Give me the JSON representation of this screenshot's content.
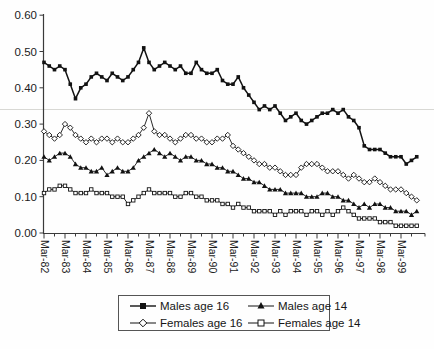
{
  "chart_data": {
    "type": "line",
    "title": "",
    "xlabel": "",
    "ylabel": "",
    "ylim": [
      0.0,
      0.6
    ],
    "y_tick_labels": [
      "0.00",
      "0.10",
      "0.20",
      "0.30",
      "0.40",
      "0.50",
      "0.60"
    ],
    "x_tick_labels": [
      "Mar-82",
      "Mar-83",
      "Mar-84",
      "Mar-85",
      "Mar-86",
      "Mar-87",
      "Mar-88",
      "Mar-89",
      "Mar-90",
      "Mar-91",
      "Mar-92",
      "Mar-93",
      "Mar-94",
      "Mar-95",
      "Mar-96",
      "Mar-97",
      "Mar-98",
      "Mar-99"
    ],
    "x_resolution": "quarterly, Mar-1982 to Dec-1999",
    "grid": "off",
    "legend_position": "bottom",
    "series": [
      {
        "name": "Males age 16",
        "marker": "filled-square",
        "values": [
          0.47,
          0.46,
          0.45,
          0.46,
          0.45,
          0.41,
          0.37,
          0.4,
          0.41,
          0.43,
          0.44,
          0.43,
          0.42,
          0.44,
          0.43,
          0.42,
          0.43,
          0.45,
          0.47,
          0.51,
          0.47,
          0.45,
          0.46,
          0.47,
          0.46,
          0.45,
          0.46,
          0.44,
          0.44,
          0.47,
          0.45,
          0.44,
          0.44,
          0.45,
          0.42,
          0.41,
          0.41,
          0.43,
          0.4,
          0.38,
          0.36,
          0.34,
          0.35,
          0.34,
          0.35,
          0.33,
          0.31,
          0.32,
          0.33,
          0.31,
          0.3,
          0.31,
          0.32,
          0.33,
          0.33,
          0.34,
          0.33,
          0.34,
          0.32,
          0.31,
          0.29,
          0.24,
          0.23,
          0.23,
          0.23,
          0.22,
          0.21,
          0.21,
          0.21,
          0.19,
          0.2,
          0.21
        ]
      },
      {
        "name": "Females age 16",
        "marker": "open-diamond",
        "values": [
          0.28,
          0.27,
          0.26,
          0.27,
          0.3,
          0.29,
          0.27,
          0.26,
          0.25,
          0.26,
          0.25,
          0.26,
          0.26,
          0.25,
          0.26,
          0.25,
          0.25,
          0.26,
          0.27,
          0.29,
          0.33,
          0.28,
          0.27,
          0.27,
          0.26,
          0.25,
          0.26,
          0.27,
          0.27,
          0.26,
          0.26,
          0.25,
          0.25,
          0.26,
          0.26,
          0.27,
          0.24,
          0.23,
          0.22,
          0.21,
          0.2,
          0.19,
          0.19,
          0.18,
          0.18,
          0.17,
          0.16,
          0.16,
          0.16,
          0.18,
          0.19,
          0.19,
          0.19,
          0.18,
          0.17,
          0.17,
          0.17,
          0.16,
          0.15,
          0.16,
          0.15,
          0.14,
          0.14,
          0.15,
          0.14,
          0.13,
          0.12,
          0.12,
          0.12,
          0.11,
          0.1,
          0.09
        ]
      },
      {
        "name": "Males age 14",
        "marker": "filled-triangle",
        "values": [
          0.21,
          0.2,
          0.21,
          0.22,
          0.22,
          0.21,
          0.19,
          0.18,
          0.18,
          0.17,
          0.17,
          0.18,
          0.16,
          0.17,
          0.18,
          0.17,
          0.17,
          0.18,
          0.2,
          0.21,
          0.22,
          0.23,
          0.22,
          0.21,
          0.22,
          0.21,
          0.2,
          0.21,
          0.21,
          0.2,
          0.2,
          0.19,
          0.19,
          0.18,
          0.18,
          0.17,
          0.17,
          0.16,
          0.15,
          0.15,
          0.14,
          0.14,
          0.13,
          0.12,
          0.12,
          0.12,
          0.11,
          0.11,
          0.11,
          0.11,
          0.1,
          0.1,
          0.1,
          0.11,
          0.11,
          0.1,
          0.1,
          0.09,
          0.09,
          0.08,
          0.07,
          0.08,
          0.07,
          0.08,
          0.08,
          0.07,
          0.07,
          0.06,
          0.06,
          0.06,
          0.05,
          0.06
        ]
      },
      {
        "name": "Females age 14",
        "marker": "open-square",
        "values": [
          0.11,
          0.12,
          0.12,
          0.13,
          0.13,
          0.12,
          0.11,
          0.11,
          0.11,
          0.12,
          0.11,
          0.11,
          0.11,
          0.1,
          0.1,
          0.1,
          0.08,
          0.09,
          0.1,
          0.11,
          0.12,
          0.11,
          0.11,
          0.11,
          0.11,
          0.1,
          0.1,
          0.11,
          0.11,
          0.1,
          0.1,
          0.09,
          0.09,
          0.09,
          0.08,
          0.08,
          0.07,
          0.08,
          0.07,
          0.07,
          0.06,
          0.06,
          0.06,
          0.06,
          0.05,
          0.06,
          0.05,
          0.06,
          0.06,
          0.06,
          0.05,
          0.06,
          0.06,
          0.05,
          0.06,
          0.05,
          0.06,
          0.07,
          0.06,
          0.05,
          0.04,
          0.04,
          0.04,
          0.04,
          0.03,
          0.03,
          0.03,
          0.02,
          0.02,
          0.02,
          0.02,
          0.02
        ]
      }
    ]
  },
  "legend": {
    "entries": [
      "Males age 16",
      "Males age 14",
      "Females age 16",
      "Females age 14"
    ]
  },
  "colors": {
    "series": "#121212",
    "axis": "#3a3a3a",
    "tick_label": "#1b1b1b",
    "background": "#fefefe",
    "artifact_line": "#d8d8d4",
    "open_marker_fill": "#ffffff"
  }
}
